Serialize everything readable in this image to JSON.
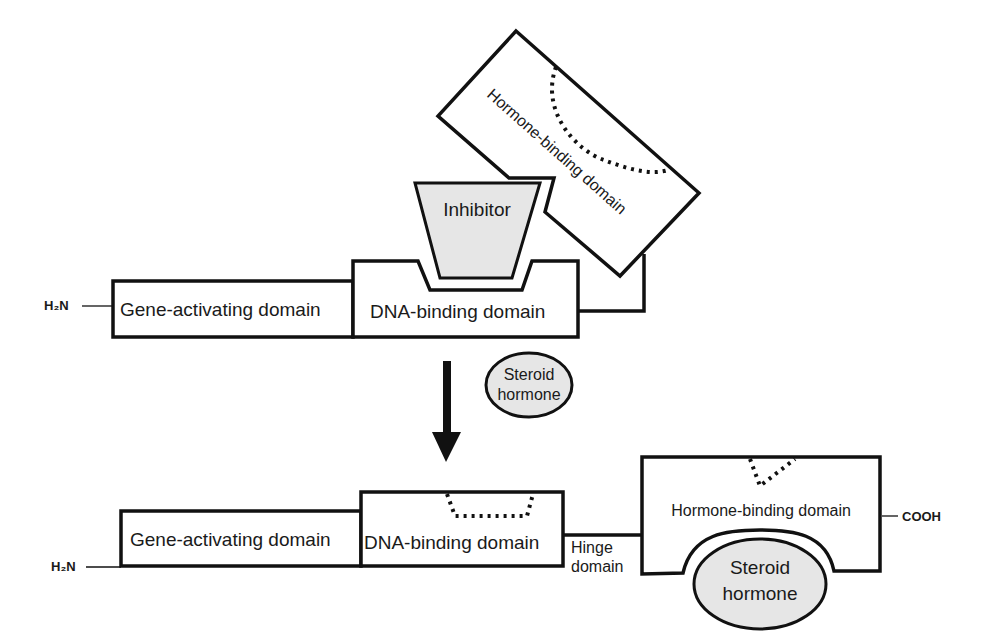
{
  "diagram": {
    "inactive_state": {
      "n_terminus": "H₂N",
      "gene_activating_domain": "Gene-activating domain",
      "dna_binding_domain": "DNA-binding domain",
      "inhibitor": "Inhibitor",
      "hormone_binding_domain": "Hormone-binding domain"
    },
    "transition": {
      "arrow": "down-arrow",
      "ligand_line1": "Steroid",
      "ligand_line2": "hormone"
    },
    "active_state": {
      "n_terminus": "H₂N",
      "gene_activating_domain": "Gene-activating domain",
      "dna_binding_domain": "DNA-binding domain",
      "hinge_line1": "Hinge",
      "hinge_line2": "domain",
      "hormone_binding_domain": "Hormone-binding domain",
      "c_terminus": "COOH",
      "bound_ligand_line1": "Steroid",
      "bound_ligand_line2": "hormone"
    },
    "colors": {
      "stroke": "#111111",
      "fill_gray": "#e6e6e6",
      "background": "#ffffff"
    }
  }
}
